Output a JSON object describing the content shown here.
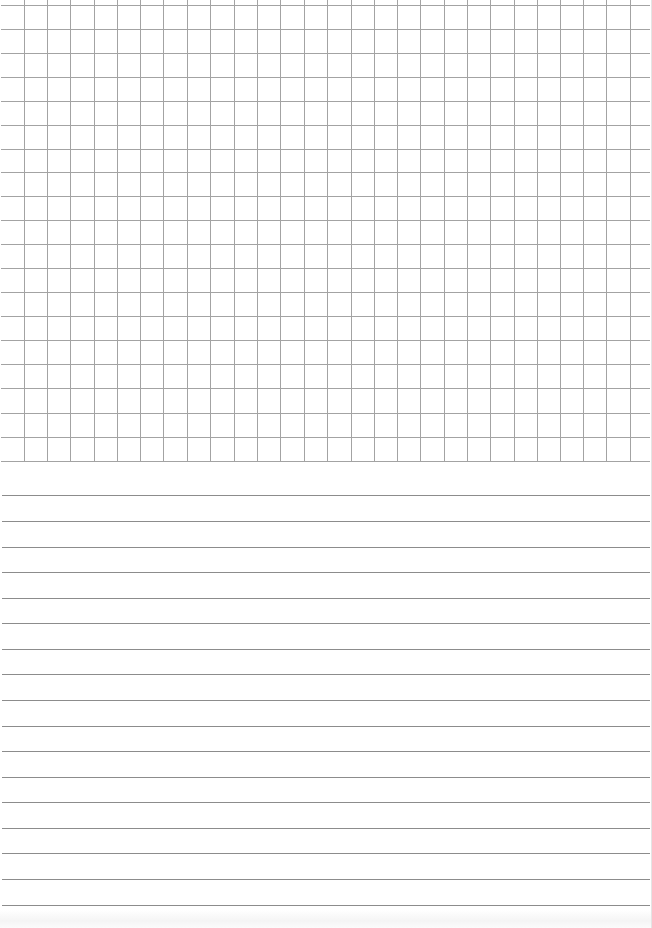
{
  "page": {
    "kind": "notebook-sheet",
    "width": 652,
    "height": 928,
    "background": "#ffffff",
    "edge_color": "#e4e4e4"
  },
  "grid_section": {
    "label": "graph paper area",
    "line_color": "#a3a3a3",
    "bottom": 462,
    "horizontal_lines_y": [
      5,
      29,
      53,
      77,
      101,
      125,
      149,
      172,
      196,
      220,
      244,
      268,
      292,
      316,
      340,
      364,
      388,
      413,
      437,
      461
    ],
    "vertical_lines_x": [
      24,
      47,
      70,
      94,
      117,
      140,
      163,
      187,
      210,
      234,
      257,
      280,
      304,
      327,
      351,
      374,
      397,
      420,
      444,
      467,
      490,
      514,
      537,
      560,
      583,
      606,
      630
    ],
    "cell_size": 23.5
  },
  "ruled_section": {
    "label": "lined paper area",
    "line_color": "#8c8c8c",
    "lines_y": [
      495,
      521,
      547,
      572,
      598,
      623,
      649,
      674,
      700,
      726,
      751,
      777,
      802,
      828,
      853,
      879,
      905
    ],
    "line_spacing": 25.6
  }
}
